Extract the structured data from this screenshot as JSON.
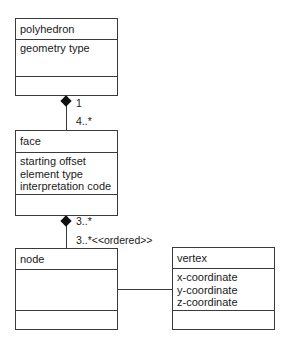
{
  "classes": {
    "polyhedron": {
      "name": "polyhedron",
      "attributes": [
        "geometry type"
      ]
    },
    "face": {
      "name": "face",
      "attributes": [
        "starting offset",
        "element type",
        "interpretation code"
      ]
    },
    "node": {
      "name": "node",
      "attributes": []
    },
    "vertex": {
      "name": "vertex",
      "attributes": [
        "x-coordinate",
        "y-coordinate",
        "z-coordinate"
      ]
    }
  },
  "associations": {
    "polyhedron_face": {
      "type": "composition",
      "source_multiplicity": "1",
      "target_multiplicity": "4..*"
    },
    "face_node": {
      "type": "composition",
      "source_multiplicity": "3..*",
      "target_multiplicity": "3..*<<ordered>>"
    },
    "node_vertex": {
      "type": "association"
    }
  }
}
